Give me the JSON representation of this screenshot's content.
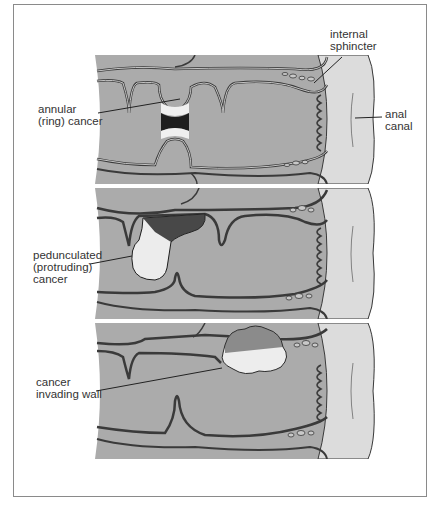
{
  "diagram": {
    "colors": {
      "tissue": "#a8a8a8",
      "tissue_light": "#bdbdbd",
      "lumen": "#b3b3b3",
      "anal_canal": "#dcdcdc",
      "outline": "#3a3a3a",
      "tumor_light": "#f2f2f2",
      "tumor_dark": "#1e1e1e",
      "frame_border": "#8a8a8a",
      "text": "#333333"
    },
    "panels": [
      {
        "id": "annular",
        "labels": [
          {
            "text": "annular\n(ring) cancer",
            "position": "left"
          },
          {
            "text": "internal\nsphincter",
            "position": "top-right"
          },
          {
            "text": "anal\ncanal",
            "position": "right"
          }
        ]
      },
      {
        "id": "pedunculated",
        "labels": [
          {
            "text": "pedunculated\n(protruding)\ncancer",
            "position": "left"
          }
        ]
      },
      {
        "id": "invading",
        "labels": [
          {
            "text": "cancer\ninvading wall",
            "position": "left"
          }
        ]
      }
    ]
  }
}
